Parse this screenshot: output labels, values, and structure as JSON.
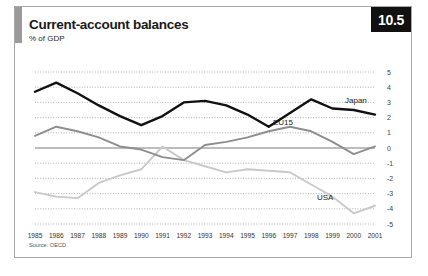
{
  "card": {
    "figure_number": "10.5",
    "title": "Current-account balances",
    "subtitle": "% of GDP",
    "source": "Source: OECD",
    "accent_color": "#9a9a9a",
    "badge_bg": "#111111"
  },
  "chart_data": {
    "type": "line",
    "title": "Current-account balances",
    "subtitle": "% of GDP",
    "xlabel": "",
    "ylabel": "% of GDP",
    "ylim": [
      -5,
      5
    ],
    "ytick_values": [
      5,
      4,
      3,
      2,
      1,
      0,
      -1,
      -2,
      -3,
      -4,
      -5
    ],
    "ytick_labels": [
      "5",
      "4",
      "3",
      "2",
      "1",
      "0",
      "-1",
      "-2",
      "-3",
      "-4",
      "-5"
    ],
    "grid": true,
    "grid_style": "dotted",
    "zero_line": true,
    "legend_position": "inline-labels",
    "categories": [
      "1985",
      "1986",
      "1987",
      "1988",
      "1989",
      "1990",
      "1991",
      "1992",
      "1993",
      "1994",
      "1995",
      "1996",
      "1997",
      "1998",
      "1999",
      "2000",
      "2001"
    ],
    "series": [
      {
        "name": "Japan",
        "color": "#111111",
        "label_x": "2001",
        "values": [
          3.7,
          4.3,
          3.6,
          2.8,
          2.1,
          1.5,
          2.1,
          3.0,
          3.1,
          2.8,
          2.2,
          1.4,
          2.3,
          3.2,
          2.6,
          2.5,
          2.2
        ]
      },
      {
        "name": "EU15",
        "color": "#8e8e8e",
        "label_x": "1997",
        "values": [
          0.8,
          1.4,
          1.1,
          0.7,
          0.1,
          -0.1,
          -0.6,
          -0.8,
          0.2,
          0.4,
          0.7,
          1.1,
          1.4,
          1.1,
          0.4,
          -0.4,
          0.1
        ]
      },
      {
        "name": "USA",
        "color": "#c9c9c9",
        "label_x": "1998",
        "values": [
          -2.9,
          -3.2,
          -3.3,
          -2.3,
          -1.8,
          -1.4,
          0.1,
          -0.8,
          -1.2,
          -1.6,
          -1.4,
          -1.5,
          -1.6,
          -2.4,
          -3.2,
          -4.3,
          -3.8
        ]
      }
    ]
  }
}
